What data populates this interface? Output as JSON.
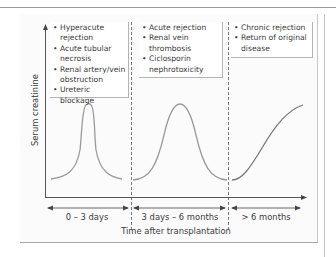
{
  "figure": {
    "y_axis_label": "Serum creatinine",
    "x_axis_label": "Time after transplantation",
    "periods": [
      {
        "label": "0 – 3 days",
        "causes": [
          "Hyperacute rejection",
          "Acute tubular necrosis",
          "Renal artery/vein obstruction",
          "Ureteric blockage"
        ],
        "curve": "sharp-peak"
      },
      {
        "label": "3 days – 6 months",
        "causes": [
          "Acute rejection",
          "Renal vein thrombosis",
          "Ciclosporin nephrotoxicity"
        ],
        "curve": "broad-peak"
      },
      {
        "label": "> 6 months",
        "causes": [
          "Chronic rejection",
          "Return of original disease"
        ],
        "curve": "gradual-rise"
      }
    ],
    "bullet": "•",
    "colors": {
      "curve": "#9a9a9a",
      "axis": "#555555",
      "divider": "#555555",
      "panel": "#fbfbfb",
      "box_border": "#b4b4b4"
    }
  }
}
